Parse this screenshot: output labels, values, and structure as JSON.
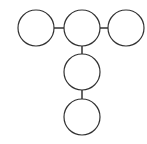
{
  "diagram": {
    "type": "node-link",
    "stroke_color": "#333333",
    "fill_color": "#ffffff",
    "nodes": [
      {
        "id": "n1",
        "cx": 36,
        "cy": 28,
        "r": 18
      },
      {
        "id": "n2",
        "cx": 82,
        "cy": 28,
        "r": 18
      },
      {
        "id": "n3",
        "cx": 126,
        "cy": 28,
        "r": 18
      },
      {
        "id": "n4",
        "cx": 82,
        "cy": 72,
        "r": 18
      },
      {
        "id": "n5",
        "cx": 82,
        "cy": 117,
        "r": 18
      }
    ],
    "edges": [
      {
        "from": "n1",
        "to": "n2"
      },
      {
        "from": "n2",
        "to": "n3"
      },
      {
        "from": "n2",
        "to": "n4"
      },
      {
        "from": "n4",
        "to": "n5"
      }
    ]
  }
}
